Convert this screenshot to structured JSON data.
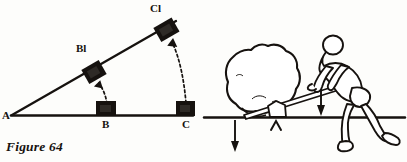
{
  "page": {
    "background_color": "#fdfdfb",
    "ink_color": "#16120f",
    "width": 407,
    "height": 162
  },
  "figure_64": {
    "caption": "Figure 64",
    "description": "Inclined plane diagram: a horizontal base line from A through B to C, with a straight inclined line rising from A; blocks at B and C on the base move up to positions B1 and C1 on the incline, indicated by dashed curved arrows.",
    "points": [
      {
        "id": "A",
        "label": "A",
        "x": 12,
        "y": 115,
        "role": "apex"
      },
      {
        "id": "B",
        "label": "B",
        "x": 105,
        "y": 115,
        "role": "base-point"
      },
      {
        "id": "C",
        "label": "C",
        "x": 185,
        "y": 115,
        "role": "base-point"
      },
      {
        "id": "B1",
        "label": "Bl",
        "x": 94,
        "y": 72,
        "role": "incline-point"
      },
      {
        "id": "C1",
        "label": "Cl",
        "x": 166,
        "y": 30,
        "role": "incline-point"
      }
    ],
    "lines": [
      {
        "name": "base-line",
        "from": "A",
        "to": "C",
        "style": "solid"
      },
      {
        "name": "incline-line",
        "from": "A",
        "to": "C1",
        "style": "solid"
      }
    ],
    "blocks": [
      {
        "name": "block-b",
        "at": "B",
        "tilted": false
      },
      {
        "name": "block-c",
        "at": "C",
        "tilted": false
      },
      {
        "name": "block-b1",
        "at": "B1",
        "tilted": true
      },
      {
        "name": "block-c1",
        "at": "C1",
        "tilted": true
      }
    ],
    "arrows": [
      {
        "name": "arrow-b-to-b1",
        "from": "B",
        "to": "B1",
        "style": "dashed-curved"
      },
      {
        "name": "arrow-c-to-c1",
        "from": "C",
        "to": "C1",
        "style": "dashed-curved"
      }
    ]
  },
  "figure_65": {
    "caption": "Figure 65",
    "description": "Lever diagram: a man bends over and presses down with force F on the end of a lever bar; the bar pivots on a small stone fulcrum at A and lifts a large boulder whose resistance R acts downward at the left end.",
    "labels": [
      {
        "id": "R",
        "label": "R",
        "meaning": "resistance-force",
        "direction": "down",
        "x": 242,
        "y": 124
      },
      {
        "id": "A",
        "label": "A",
        "meaning": "fulcrum",
        "direction": "none",
        "x": 276,
        "y": 133
      },
      {
        "id": "F",
        "label": "F",
        "meaning": "applied-effort-force",
        "direction": "down",
        "x": 327,
        "y": 92
      }
    ],
    "elements": [
      {
        "name": "boulder",
        "description": "large irregular rock at left"
      },
      {
        "name": "lever-bar",
        "description": "long straight bar from under the boulder up to the man's hands"
      },
      {
        "name": "fulcrum-stone",
        "description": "small pentagonal stone supporting the bar"
      },
      {
        "name": "ground-line",
        "description": "horizontal ground line"
      },
      {
        "name": "man-figure",
        "description": "outline drawing of a bent-over man pushing down on the lever"
      }
    ]
  }
}
